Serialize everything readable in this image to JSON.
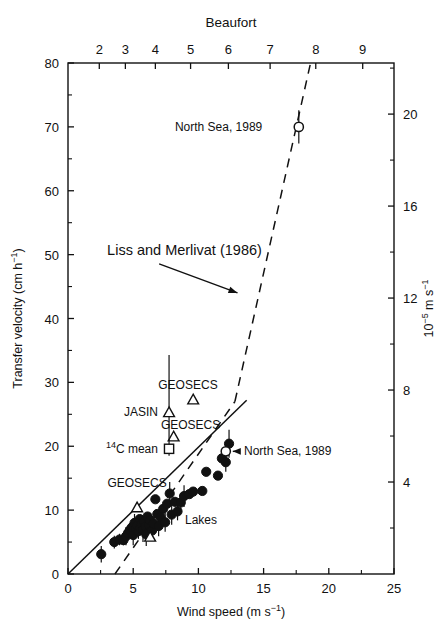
{
  "figure": {
    "background": "#ffffff",
    "ink": "#111111"
  },
  "chart_data": {
    "type": "scatter",
    "title": "",
    "xlabel": "Wind speed (m s−1)",
    "ylabel": "Transfer velocity (cm h−1)",
    "xlim": [
      0,
      25
    ],
    "ylim": [
      0,
      80
    ],
    "grid": false,
    "legend": "none",
    "top_axis": {
      "label": "Beaufort",
      "ticks": [
        2,
        3,
        4,
        5,
        6,
        7,
        8,
        9
      ],
      "tick_wind_speed": [
        2.4,
        4.4,
        6.7,
        9.4,
        12.3,
        15.5,
        19.0,
        22.6
      ],
      "tick_labels": [
        "2",
        "3",
        "4",
        "5",
        "6",
        "7",
        "8",
        "9"
      ]
    },
    "right_axis": {
      "label": "10−5 m s−1",
      "ticks": [
        4,
        8,
        12,
        16,
        20
      ],
      "tick_labels": [
        "4",
        "8",
        "12",
        "16",
        "20"
      ],
      "minor_ticks": [
        2,
        6,
        10,
        14,
        18,
        22
      ],
      "conversion_cm_h_per_unit": 3.6
    },
    "x_ticks": [
      0,
      5,
      10,
      15,
      20,
      25
    ],
    "x_tick_labels": [
      "0",
      "5",
      "10",
      "15",
      "20",
      "25"
    ],
    "y_ticks": [
      0,
      10,
      20,
      30,
      40,
      50,
      60,
      70,
      80
    ],
    "y_tick_labels": [
      "0",
      "10",
      "20",
      "30",
      "40",
      "50",
      "60",
      "70",
      "80"
    ],
    "series": [
      {
        "name": "Lakes",
        "marker": "filled-circle",
        "points": [
          {
            "x": 2.55,
            "y": 3.1,
            "yerr": 1.3
          },
          {
            "x": 3.55,
            "y": 5.0,
            "yerr": 1.0
          },
          {
            "x": 3.95,
            "y": 5.4,
            "yerr": 0.9
          },
          {
            "x": 4.25,
            "y": 5.3,
            "yerr": 0.8
          },
          {
            "x": 4.45,
            "y": 5.9,
            "yerr": 1.4
          },
          {
            "x": 4.6,
            "y": 6.4,
            "yerr": 0.0
          },
          {
            "x": 4.75,
            "y": 6.9,
            "yerr": 1.1
          },
          {
            "x": 4.9,
            "y": 7.3,
            "yerr": 0.0
          },
          {
            "x": 5.0,
            "y": 6.1,
            "yerr": 1.6
          },
          {
            "x": 5.1,
            "y": 8.0,
            "yerr": 1.4
          },
          {
            "x": 5.2,
            "y": 7.0,
            "yerr": 0.0
          },
          {
            "x": 5.3,
            "y": 7.6,
            "yerr": 0.0
          },
          {
            "x": 5.4,
            "y": 6.7,
            "yerr": 1.2
          },
          {
            "x": 5.5,
            "y": 8.6,
            "yerr": 0.0
          },
          {
            "x": 5.55,
            "y": 7.2,
            "yerr": 0.0
          },
          {
            "x": 5.65,
            "y": 7.8,
            "yerr": 0.0
          },
          {
            "x": 5.75,
            "y": 6.9,
            "yerr": 1.9
          },
          {
            "x": 5.85,
            "y": 8.2,
            "yerr": 0.0
          },
          {
            "x": 5.95,
            "y": 7.4,
            "yerr": 0.0
          },
          {
            "x": 6.0,
            "y": 6.2,
            "yerr": 1.8
          },
          {
            "x": 6.1,
            "y": 9.0,
            "yerr": 0.0
          },
          {
            "x": 6.2,
            "y": 7.7,
            "yerr": 0.0
          },
          {
            "x": 6.3,
            "y": 8.4,
            "yerr": 1.2
          },
          {
            "x": 6.45,
            "y": 6.8,
            "yerr": 1.5
          },
          {
            "x": 6.55,
            "y": 7.9,
            "yerr": 0.0
          },
          {
            "x": 6.7,
            "y": 11.7,
            "yerr": 0.0
          },
          {
            "x": 6.85,
            "y": 9.4,
            "yerr": 0.0
          },
          {
            "x": 6.95,
            "y": 7.5,
            "yerr": 1.6
          },
          {
            "x": 7.1,
            "y": 8.9,
            "yerr": 1.1
          },
          {
            "x": 7.3,
            "y": 10.2,
            "yerr": 0.0
          },
          {
            "x": 7.45,
            "y": 8.1,
            "yerr": 1.5
          },
          {
            "x": 7.6,
            "y": 11.0,
            "yerr": 0.0
          },
          {
            "x": 7.8,
            "y": 12.6,
            "yerr": 1.8
          },
          {
            "x": 7.95,
            "y": 9.3,
            "yerr": 1.6
          },
          {
            "x": 8.2,
            "y": 11.3,
            "yerr": 0.0
          },
          {
            "x": 8.4,
            "y": 9.8,
            "yerr": 1.4
          },
          {
            "x": 8.65,
            "y": 11.2,
            "yerr": 1.4
          },
          {
            "x": 8.9,
            "y": 12.2,
            "yerr": 1.7
          },
          {
            "x": 9.3,
            "y": 12.5,
            "yerr": 0.0
          },
          {
            "x": 9.6,
            "y": 12.9,
            "yerr": 0.0
          },
          {
            "x": 10.3,
            "y": 13.0,
            "yerr": 0.0
          },
          {
            "x": 10.6,
            "y": 16.0,
            "yerr": 0.0
          },
          {
            "x": 11.5,
            "y": 15.4,
            "yerr": 0.0
          },
          {
            "x": 11.8,
            "y": 18.1,
            "yerr": 0.0
          },
          {
            "x": 12.1,
            "y": 17.5,
            "yerr": 1.5
          },
          {
            "x": 12.35,
            "y": 20.4,
            "yerr": 2.2
          }
        ]
      },
      {
        "name": "GEOSECS",
        "marker": "open-triangle",
        "points": [
          {
            "x": 5.3,
            "y": 10.4,
            "yerr": 0.0
          },
          {
            "x": 6.3,
            "y": 5.8,
            "yerr": 0.0
          },
          {
            "x": 8.1,
            "y": 21.5,
            "yerr": 0.0
          },
          {
            "x": 9.6,
            "y": 27.3,
            "yerr": 0.0
          }
        ]
      },
      {
        "name": "JASIN",
        "marker": "open-triangle",
        "points": [
          {
            "x": 7.75,
            "y": 25.3,
            "yerr_up": 9.0,
            "yerr_down": 6.8
          }
        ]
      },
      {
        "name": "14C mean",
        "marker": "open-square",
        "points": [
          {
            "x": 7.75,
            "y": 19.6,
            "yerr": 0.0
          }
        ]
      },
      {
        "name": "North Sea, 1989",
        "marker": "open-circle",
        "points": [
          {
            "x": 17.7,
            "y": 70.0,
            "yerr": 2.6
          },
          {
            "x": 12.1,
            "y": 19.2,
            "yerr": 0.0
          }
        ]
      }
    ],
    "lines": [
      {
        "name": "Liss and Merlivat (1986)",
        "style": "dashed",
        "segments": [
          {
            "x1": 3.6,
            "y1": 0.0,
            "x2": 12.8,
            "y2": 27.0
          },
          {
            "x1": 12.8,
            "y1": 27.0,
            "x2": 18.6,
            "y2": 80.0
          }
        ]
      },
      {
        "name": "fit line",
        "style": "solid",
        "segments": [
          {
            "x1": 0.0,
            "y1": 0.0,
            "x2": 13.7,
            "y2": 27.2
          }
        ]
      }
    ],
    "annotations": [
      {
        "id": "north-sea-top",
        "text": "North Sea, 1989",
        "x": 14.9,
        "y": 70.0,
        "align": "right"
      },
      {
        "id": "liss-merlivat",
        "text": "Liss and Merlivat (1986)",
        "x": 3.0,
        "y": 50.6,
        "align": "left",
        "arrow_to": {
          "x": 13.0,
          "y": 44.0
        }
      },
      {
        "id": "geosecs-upper",
        "text": "GEOSECS",
        "x": 9.2,
        "y": 29.6,
        "align": "center"
      },
      {
        "id": "jasin",
        "text": "JASIN",
        "x": 6.9,
        "y": 25.3,
        "align": "right"
      },
      {
        "id": "geosecs-mid",
        "text": "GEOSECS",
        "x": 9.4,
        "y": 23.3,
        "align": "center"
      },
      {
        "id": "c14-mean",
        "text": "14C mean",
        "x": 6.9,
        "y": 19.6,
        "align": "right"
      },
      {
        "id": "geosecs-lower",
        "text": "GEOSECS",
        "x": 5.3,
        "y": 14.2,
        "align": "center"
      },
      {
        "id": "north-sea-mid",
        "text": "North Sea, 1989",
        "x": 13.5,
        "y": 19.2,
        "align": "left"
      },
      {
        "id": "lakes",
        "text": "Lakes",
        "x": 10.2,
        "y": 8.4,
        "align": "center"
      }
    ]
  },
  "labels": {
    "beaufort": "Beaufort",
    "transfer_velocity": "Transfer velocity (cm h",
    "transfer_velocity_sup": "−1",
    "transfer_velocity_tail": ")",
    "wind_speed": "Wind speed (m s",
    "wind_speed_sup": "−1",
    "wind_speed_tail": ")",
    "right_axis_base": "10",
    "right_axis_exp": "−5",
    "right_axis_rest": " m s",
    "right_axis_exp2": "−1",
    "annot_north_sea_top": "North Sea, 1989",
    "annot_liss": "Liss and Merlivat (1986)",
    "annot_geosecs_1": "GEOSECS",
    "annot_jasin": "JASIN",
    "annot_geosecs_2": "GEOSECS",
    "annot_c14_sup": "14",
    "annot_c14": "C mean",
    "annot_geosecs_3": "GEOSECS",
    "annot_north_sea_mid": "North Sea, 1989",
    "annot_lakes": "Lakes"
  }
}
